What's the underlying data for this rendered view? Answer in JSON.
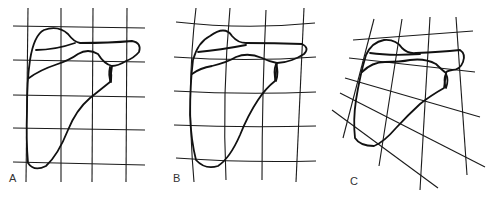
{
  "figure": {
    "panels": [
      {
        "id": "A",
        "label": "A",
        "grid": "rectangular"
      },
      {
        "id": "B",
        "label": "B",
        "grid": "curvilinear"
      },
      {
        "id": "C",
        "label": "C",
        "grid": "skewed"
      }
    ],
    "colors": {
      "line": "#111111",
      "background": "#ffffff"
    }
  }
}
